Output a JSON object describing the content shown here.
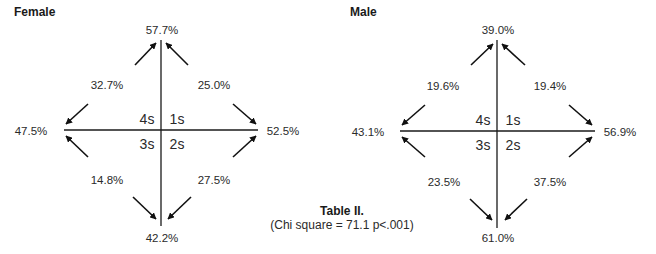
{
  "panels": [
    {
      "title": "Female",
      "top": "57.7%",
      "bottom": "42.2%",
      "left": "47.5%",
      "right": "52.5%",
      "upper_left": "32.7%",
      "upper_right": "25.0%",
      "lower_left": "14.8%",
      "lower_right": "27.5%",
      "quadrants": {
        "q1": "1s",
        "q2": "2s",
        "q3": "3s",
        "q4": "4s"
      }
    },
    {
      "title": "Male",
      "top": "39.0%",
      "bottom": "61.0%",
      "left": "43.1%",
      "right": "56.9%",
      "upper_left": "19.6%",
      "upper_right": "19.4%",
      "lower_left": "23.5%",
      "lower_right": "37.5%",
      "quadrants": {
        "q1": "1s",
        "q2": "2s",
        "q3": "3s",
        "q4": "4s"
      }
    }
  ],
  "caption": {
    "title": "Table II.",
    "subtitle": "(Chi square = 71.1 p<.001)"
  },
  "colors": {
    "line": "#1a1a1a",
    "text": "#2a2a2a"
  }
}
